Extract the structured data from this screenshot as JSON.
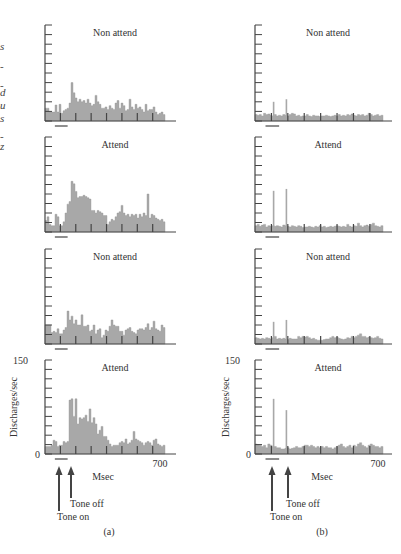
{
  "left_edge_fragments": [
    "s",
    "-",
    "-",
    "d",
    "u",
    "s",
    "-",
    "z"
  ],
  "chart_data": {
    "type": "bar",
    "title": "",
    "xlabel": "Msec",
    "ylabel": "Discharges/sec",
    "xlim": [
      0,
      700
    ],
    "ylim": [
      0,
      150
    ],
    "x_tick_labels": [
      "0",
      "700"
    ],
    "y_tick_labels": [
      "0",
      "150"
    ],
    "annotations": [
      "Tone on",
      "Tone off"
    ],
    "tone_on_ms": 50,
    "tone_off_ms": 120,
    "bin_count": 60,
    "columns": [
      {
        "label": "(a)",
        "panels": [
          {
            "title": "Non attend",
            "values": [
              20,
              20,
              14,
              14,
              14,
              25,
              14,
              26,
              12,
              16,
              18,
              20,
              28,
              60,
              44,
              36,
              30,
              34,
              30,
              32,
              28,
              34,
              28,
              24,
              26,
              40,
              30,
              26,
              20,
              20,
              22,
              18,
              24,
              20,
              18,
              28,
              32,
              20,
              28,
              24,
              16,
              18,
              34,
              22,
              18,
              26,
              20,
              22,
              18,
              14,
              26,
              16,
              18,
              18,
              22,
              14,
              10,
              12,
              14,
              10
            ],
            "sparse_spikes": []
          },
          {
            "title": "Attend",
            "values": [
              18,
              24,
              12,
              10,
              10,
              28,
              24,
              10,
              10,
              16,
              30,
              44,
              48,
              80,
              76,
              64,
              54,
              56,
              56,
              58,
              56,
              54,
              52,
              34,
              34,
              30,
              34,
              32,
              30,
              26,
              26,
              12,
              16,
              20,
              18,
              24,
              30,
              32,
              42,
              30,
              26,
              28,
              24,
              28,
              26,
              28,
              22,
              28,
              24,
              30,
              26,
              60,
              22,
              28,
              26,
              22,
              20,
              18,
              20,
              16
            ],
            "sparse_spikes": []
          },
          {
            "title": "Non attend",
            "values": [
              30,
              30,
              30,
              18,
              20,
              18,
              24,
              16,
              16,
              22,
              26,
              52,
              38,
              44,
              32,
              38,
              30,
              30,
              46,
              28,
              28,
              30,
              20,
              22,
              30,
              16,
              22,
              24,
              10,
              14,
              22,
              20,
              28,
              38,
              30,
              28,
              28,
              20,
              20,
              14,
              22,
              24,
              26,
              20,
              18,
              16,
              22,
              24,
              24,
              22,
              26,
              32,
              22,
              26,
              36,
              24,
              22,
              20,
              30,
              26
            ],
            "sparse_spikes": []
          },
          {
            "title": "Attend",
            "values": [
              12,
              12,
              12,
              14,
              22,
              20,
              12,
              14,
              14,
              20,
              18,
              20,
              86,
              88,
              60,
              88,
              48,
              58,
              56,
              58,
              62,
              52,
              72,
              50,
              58,
              48,
              32,
              38,
              44,
              28,
              28,
              22,
              16,
              12,
              14,
              14,
              14,
              18,
              20,
              18,
              24,
              16,
              18,
              22,
              36,
              24,
              22,
              20,
              18,
              14,
              18,
              20,
              18,
              14,
              22,
              24,
              16,
              14,
              12,
              14
            ],
            "sparse_spikes": []
          }
        ]
      },
      {
        "label": "(b)",
        "panels": [
          {
            "title": "Non attend",
            "values": [
              10,
              9,
              10,
              8,
              12,
              10,
              11,
              9,
              8,
              10,
              8,
              9,
              8,
              10,
              9,
              8,
              10,
              12,
              11,
              8,
              9,
              7,
              8,
              8,
              10,
              8,
              7,
              9,
              8,
              8,
              7,
              8,
              8,
              9,
              8,
              7,
              8,
              9,
              8,
              10,
              8,
              9,
              8,
              10,
              9,
              11,
              9,
              8,
              10,
              9,
              10,
              8,
              9,
              12,
              10,
              8,
              9,
              10,
              8,
              9
            ],
            "sparse_spikes": [
              {
                "bin": 8,
                "value": 30
              },
              {
                "bin": 14,
                "value": 34
              }
            ]
          },
          {
            "title": "Attend",
            "values": [
              10,
              12,
              9,
              11,
              12,
              8,
              10,
              9,
              10,
              9,
              10,
              9,
              8,
              11,
              10,
              9,
              8,
              10,
              9,
              8,
              10,
              9,
              7,
              8,
              8,
              9,
              8,
              7,
              9,
              8,
              10,
              8,
              9,
              7,
              8,
              9,
              8,
              9,
              10,
              9,
              8,
              9,
              8,
              12,
              9,
              8,
              10,
              9,
              14,
              10,
              8,
              10,
              11,
              9,
              12,
              14,
              10,
              9,
              8,
              10
            ],
            "sparse_spikes": [
              {
                "bin": 8,
                "value": 65
              },
              {
                "bin": 14,
                "value": 68
              }
            ]
          },
          {
            "title": "Non attend",
            "values": [
              10,
              9,
              8,
              9,
              8,
              10,
              9,
              8,
              10,
              12,
              8,
              9,
              8,
              9,
              8,
              7,
              9,
              8,
              8,
              8,
              12,
              10,
              12,
              11,
              12,
              10,
              8,
              9,
              7,
              6,
              6,
              6,
              7,
              8,
              8,
              10,
              12,
              10,
              11,
              9,
              8,
              7,
              8,
              10,
              9,
              12,
              10,
              12,
              14,
              16,
              12,
              12,
              10,
              11,
              10,
              9,
              10,
              12,
              9,
              8
            ],
            "sparse_spikes": [
              {
                "bin": 8,
                "value": 35
              },
              {
                "bin": 14,
                "value": 38
              }
            ]
          },
          {
            "title": "Attend",
            "values": [
              16,
              15,
              14,
              12,
              14,
              10,
              16,
              14,
              12,
              12,
              10,
              10,
              8,
              8,
              9,
              10,
              8,
              9,
              10,
              12,
              10,
              10,
              12,
              14,
              14,
              12,
              14,
              12,
              10,
              12,
              10,
              12,
              10,
              12,
              10,
              10,
              8,
              10,
              12,
              14,
              16,
              12,
              10,
              12,
              14,
              10,
              14,
              12,
              16,
              18,
              14,
              12,
              10,
              14,
              16,
              14,
              12,
              12,
              10,
              12
            ],
            "sparse_spikes": [
              {
                "bin": 8,
                "value": 88
              },
              {
                "bin": 14,
                "value": 70
              }
            ]
          }
        ]
      }
    ]
  },
  "labels": {
    "y_max": "150",
    "y_min": "0",
    "x_max": "700",
    "x_axis": "Msec",
    "y_axis": "Discharges/sec",
    "tone_on": "Tone on",
    "tone_off": "Tone off",
    "panel_a": "(a)",
    "panel_b": "(b)"
  },
  "colors": {
    "bar_fill": "#a8a8a8",
    "axis": "#444444",
    "text": "#333333",
    "background": "#ffffff"
  }
}
